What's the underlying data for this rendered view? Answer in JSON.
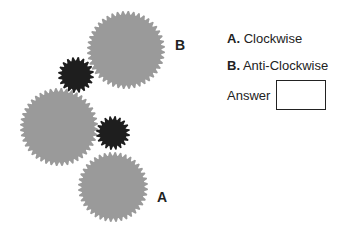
{
  "gears": [
    {
      "id": "B",
      "cx": 126,
      "cy": 50,
      "r": 39,
      "teeth": 44,
      "color": "#9a9a9a",
      "label": "B"
    },
    {
      "id": "small-1",
      "cx": 76,
      "cy": 75,
      "r": 18,
      "teeth": 20,
      "color": "#1e1e1e"
    },
    {
      "id": "left",
      "cx": 59,
      "cy": 127,
      "r": 39,
      "teeth": 44,
      "color": "#9a9a9a"
    },
    {
      "id": "small-2",
      "cx": 113,
      "cy": 133,
      "r": 17,
      "teeth": 20,
      "color": "#1e1e1e"
    },
    {
      "id": "A",
      "cx": 113,
      "cy": 187,
      "r": 35,
      "teeth": 40,
      "color": "#9a9a9a",
      "label": "A"
    }
  ],
  "labels": {
    "a": "A",
    "b": "B"
  },
  "options": [
    {
      "key": "A.",
      "text": "Clockwise"
    },
    {
      "key": "B.",
      "text": "Anti-Clockwise"
    }
  ],
  "answer": {
    "label": "Answer",
    "value": ""
  }
}
